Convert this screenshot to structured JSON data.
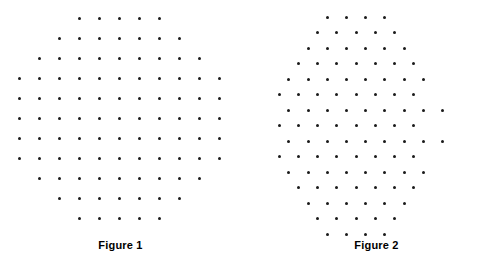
{
  "page": {
    "background_color": "#ffffff",
    "dot_color": "#1a1a1a",
    "caption_color": "#000000",
    "width": 495,
    "height": 271
  },
  "figures": [
    {
      "id": "figure-1",
      "caption": "Figure 1",
      "lattice_type": "square",
      "x_spacing": 20,
      "y_spacing": 20,
      "origin_x": 19,
      "origin_y": 18,
      "dot_diameter": 3,
      "total_dots": 97,
      "rows": [
        {
          "index": 0,
          "count": 5,
          "start_col": 3
        },
        {
          "index": 1,
          "count": 7,
          "start_col": 2
        },
        {
          "index": 2,
          "count": 9,
          "start_col": 1
        },
        {
          "index": 3,
          "count": 11,
          "start_col": 0
        },
        {
          "index": 4,
          "count": 11,
          "start_col": 0
        },
        {
          "index": 5,
          "count": 11,
          "start_col": 0
        },
        {
          "index": 6,
          "count": 11,
          "start_col": 0
        },
        {
          "index": 7,
          "count": 11,
          "start_col": 0
        },
        {
          "index": 8,
          "count": 9,
          "start_col": 1
        },
        {
          "index": 9,
          "count": 7,
          "start_col": 2
        },
        {
          "index": 10,
          "count": 5,
          "start_col": 3
        }
      ]
    },
    {
      "id": "figure-2",
      "caption": "Figure 2",
      "lattice_type": "triangular",
      "x_spacing": 19.2,
      "y_spacing": 15.5,
      "origin_x": 12,
      "origin_y": 17,
      "row_offset": 9.6,
      "dot_diameter": 3,
      "total_dots": 109,
      "rows": [
        {
          "index": 0,
          "count": 4,
          "start_col": 3,
          "offset": true
        },
        {
          "index": 1,
          "count": 5,
          "start_col": 3,
          "offset": false
        },
        {
          "index": 2,
          "count": 6,
          "start_col": 2,
          "offset": true
        },
        {
          "index": 3,
          "count": 7,
          "start_col": 2,
          "offset": false
        },
        {
          "index": 4,
          "count": 8,
          "start_col": 1,
          "offset": true
        },
        {
          "index": 5,
          "count": 8,
          "start_col": 1,
          "offset": false
        },
        {
          "index": 6,
          "count": 9,
          "start_col": 1,
          "offset": true
        },
        {
          "index": 7,
          "count": 8,
          "start_col": 1,
          "offset": false
        },
        {
          "index": 8,
          "count": 9,
          "start_col": 1,
          "offset": true
        },
        {
          "index": 9,
          "count": 8,
          "start_col": 1,
          "offset": false
        },
        {
          "index": 10,
          "count": 8,
          "start_col": 1,
          "offset": true
        },
        {
          "index": 11,
          "count": 7,
          "start_col": 2,
          "offset": false
        },
        {
          "index": 12,
          "count": 6,
          "start_col": 2,
          "offset": true
        },
        {
          "index": 13,
          "count": 5,
          "start_col": 3,
          "offset": false
        },
        {
          "index": 14,
          "count": 4,
          "start_col": 3,
          "offset": true
        }
      ]
    }
  ]
}
